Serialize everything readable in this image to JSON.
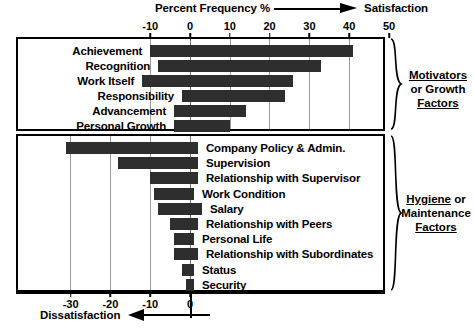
{
  "header": {
    "metric_label": "Percent Frequency %",
    "right_label": "Satisfaction",
    "arrow_icon": "right-arrow-icon"
  },
  "footer": {
    "left_label": "Dissatisfaction",
    "arrow_icon": "left-arrow-icon"
  },
  "groups": {
    "top": {
      "line1": "Motivators",
      "line2": "or Growth",
      "line3": "Factors",
      "brace_icon": "curly-brace-icon"
    },
    "bottom": {
      "line1": "Hygiene",
      "line1_tail": " or",
      "line2": "Maintenance",
      "line3": "Factors",
      "brace_icon": "curly-brace-icon"
    }
  },
  "chart_data": {
    "type": "bar",
    "orientation": "horizontal",
    "title": "Percent Frequency %",
    "xlabel": "Percent Frequency %",
    "ylabel": "",
    "grid": true,
    "legend": "none",
    "bar_color": "#2e2e2e",
    "axes": [
      {
        "name": "top-axis",
        "position": "top",
        "ticks": [
          -10,
          0,
          10,
          20,
          30,
          40,
          50
        ],
        "tick_labels": [
          "-10",
          "0",
          "10",
          "20",
          "30",
          "40",
          "50"
        ],
        "xlim": [
          -10,
          50
        ],
        "direction_label": "Satisfaction"
      },
      {
        "name": "bottom-axis",
        "position": "bottom",
        "ticks": [
          -30,
          -20,
          -10,
          0
        ],
        "tick_labels": [
          "-30",
          "-20",
          "-10",
          "0"
        ],
        "xlim": [
          -33,
          5
        ],
        "direction_label": "Dissatisfaction"
      }
    ],
    "series": [
      {
        "name": "Motivators or Growth Factors",
        "axis": "top-axis",
        "label_side": "left",
        "points": [
          {
            "category": "Achievement",
            "start": -10,
            "end": 41
          },
          {
            "category": "Recognition",
            "start": -8,
            "end": 33
          },
          {
            "category": "Work Itself",
            "start": -12,
            "end": 26
          },
          {
            "category": "Responsibility",
            "start": -2,
            "end": 24
          },
          {
            "category": "Advancement",
            "start": -4,
            "end": 14
          },
          {
            "category": "Personal Growth",
            "start": -4,
            "end": 10
          }
        ]
      },
      {
        "name": "Hygiene or Maintenance Factors",
        "axis": "bottom-axis",
        "label_side": "right",
        "points": [
          {
            "category": "Company Policy & Admin.",
            "start": -31,
            "end": 2
          },
          {
            "category": "Supervision",
            "start": -18,
            "end": 2
          },
          {
            "category": "Relationship with Supervisor",
            "start": -10,
            "end": 2
          },
          {
            "category": "Work Condition",
            "start": -9,
            "end": 1
          },
          {
            "category": "Salary",
            "start": -8,
            "end": 3
          },
          {
            "category": "Relationship with Peers",
            "start": -5,
            "end": 2
          },
          {
            "category": "Personal Life",
            "start": -4,
            "end": 1
          },
          {
            "category": "Relationship with Subordinates",
            "start": -4,
            "end": 2
          },
          {
            "category": "Status",
            "start": -2,
            "end": 1
          },
          {
            "category": "Security",
            "start": -1,
            "end": 1
          }
        ]
      }
    ]
  }
}
